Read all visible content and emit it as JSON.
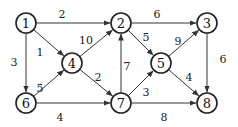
{
  "graph": {
    "directed": true,
    "nodes": [
      {
        "id": "1",
        "label": "1",
        "x": 26,
        "y": 23
      },
      {
        "id": "2",
        "label": "2",
        "x": 121,
        "y": 23
      },
      {
        "id": "3",
        "label": "3",
        "x": 207,
        "y": 23
      },
      {
        "id": "4",
        "label": "4",
        "x": 72,
        "y": 63
      },
      {
        "id": "5",
        "label": "5",
        "x": 161,
        "y": 63
      },
      {
        "id": "6",
        "label": "6",
        "x": 26,
        "y": 103
      },
      {
        "id": "7",
        "label": "7",
        "x": 121,
        "y": 103
      },
      {
        "id": "8",
        "label": "8",
        "x": 207,
        "y": 103
      }
    ],
    "edges": [
      {
        "from": "1",
        "to": "2",
        "weight": "2",
        "lx": 62,
        "ly": 14
      },
      {
        "from": "1",
        "to": "4",
        "weight": "1",
        "lx": 40,
        "ly": 52
      },
      {
        "from": "1",
        "to": "6",
        "weight": "3",
        "lx": 14,
        "ly": 62
      },
      {
        "from": "6",
        "to": "4",
        "weight": "5",
        "lx": 40,
        "ly": 88
      },
      {
        "from": "4",
        "to": "2",
        "weight": "10",
        "lx": 86,
        "ly": 40
      },
      {
        "from": "4",
        "to": "7",
        "weight": "2",
        "lx": 98,
        "ly": 77
      },
      {
        "from": "6",
        "to": "7",
        "weight": "4",
        "lx": 60,
        "ly": 117
      },
      {
        "from": "7",
        "to": "2",
        "weight": "7",
        "lx": 127,
        "ly": 66
      },
      {
        "from": "2",
        "to": "3",
        "weight": "6",
        "lx": 157,
        "ly": 14
      },
      {
        "from": "2",
        "to": "5",
        "weight": "5",
        "lx": 146,
        "ly": 37
      },
      {
        "from": "5",
        "to": "3",
        "weight": "9",
        "lx": 178,
        "ly": 41
      },
      {
        "from": "7",
        "to": "5",
        "weight": "3",
        "lx": 146,
        "ly": 92
      },
      {
        "from": "5",
        "to": "8",
        "weight": "4",
        "lx": 189,
        "ly": 77
      },
      {
        "from": "3",
        "to": "8",
        "weight": "6",
        "lx": 223,
        "ly": 59
      },
      {
        "from": "7",
        "to": "8",
        "weight": "8",
        "lx": 164,
        "ly": 117
      }
    ]
  }
}
